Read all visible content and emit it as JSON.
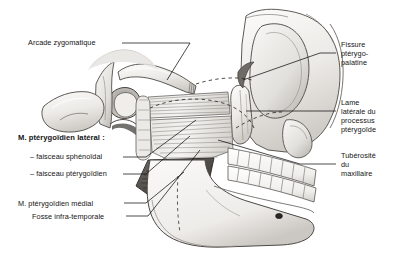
{
  "figure": {
    "background_color": "#ffffff",
    "line_color": "#1b1b1b",
    "bone_light": "#f2f1ef",
    "bone_mid": "#d8d6d2",
    "bone_shadow": "#a9a6a1",
    "muscle_dark": "#4a4845"
  },
  "labels": {
    "zygomatic_arch": "Arcade zygomatique",
    "lateral_pterygoid_title": "M. ptérygoïdien latéral :",
    "lateral_pterygoid_bundle_1": "– faisceau sphénoïdal",
    "lateral_pterygoid_bundle_2": "– faisceau ptérygoïdien",
    "medial_pterygoid": "M. ptérygoïdien médial",
    "infratemporal_fossa": "Fosse infra-temporale",
    "pterygopalatine_fissure_line_1": "Fissure",
    "pterygopalatine_fissure_line_2": "ptérygo-",
    "pterygopalatine_fissure_line_3": "palatine",
    "lateral_plate_line_1": "Lame",
    "lateral_plate_line_2": "latérale du",
    "lateral_plate_line_3": "processus",
    "lateral_plate_line_4": "ptérygoïde",
    "maxillary_tuberosity_line_1": "Tubérosité",
    "maxillary_tuberosity_line_2": "du",
    "maxillary_tuberosity_line_3": "maxillaire"
  }
}
